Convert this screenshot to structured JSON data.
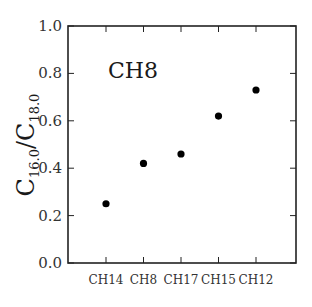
{
  "chart_data": {
    "type": "scatter",
    "title": "",
    "annotation": "CH8",
    "xlabel": "",
    "ylabel": "C16.0/C18.0",
    "ylabel_parts": {
      "main1": "C",
      "sub1": "16.0",
      "slash": "/",
      "main2": "C",
      "sub2": "18.0"
    },
    "categories": [
      "CH14",
      "CH8",
      "CH17",
      "CH15",
      "CH12"
    ],
    "values": [
      0.25,
      0.42,
      0.46,
      0.62,
      0.73
    ],
    "ylim": [
      0.0,
      1.0
    ],
    "yticks": [
      "0.0",
      "0.2",
      "0.4",
      "0.6",
      "0.8",
      "1.0"
    ],
    "grid": false,
    "legend": null,
    "marker_color": "#000000"
  }
}
